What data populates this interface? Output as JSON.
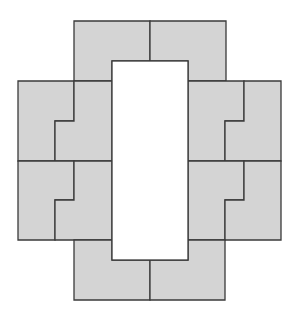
{
  "diagram": {
    "title": "",
    "width": 302,
    "height": 322,
    "fill": "#d4d4d4",
    "stroke": "#3a3a3a",
    "stroke_width": 1.3,
    "background": "#ffffff",
    "hole": {
      "x": 112,
      "y": 61,
      "width": 76,
      "height": 199
    },
    "pieces": [
      {
        "name": "piece-top-left",
        "points": "74,21 150,21 150,61 112,61 112,81 74,81"
      },
      {
        "name": "piece-top-right",
        "points": "150,21 226,21 226,81 188,81 188,61 150,61"
      },
      {
        "name": "piece-upper-left-outer",
        "points": "18,81 74,81 74,121 55,121 55,161 18,161"
      },
      {
        "name": "piece-upper-left-inner",
        "points": "74,81 112,81 112,161 55,161 55,121 74,121"
      },
      {
        "name": "piece-upper-right-inner",
        "points": "188,81 244,81 244,121 225,121 225,161 188,161"
      },
      {
        "name": "piece-upper-right-outer",
        "points": "244,81 281,81 281,161 225,161 225,121 244,121"
      },
      {
        "name": "piece-lower-left-outer",
        "points": "18,161 74,161 74,200 55,200 55,240 18,240"
      },
      {
        "name": "piece-lower-left-inner",
        "points": "74,161 112,161 112,240 55,240 55,200 74,200"
      },
      {
        "name": "piece-lower-right-inner",
        "points": "188,161 244,161 244,200 225,200 225,240 188,240"
      },
      {
        "name": "piece-lower-right-outer",
        "points": "244,161 281,161 281,240 225,240 225,200 244,200"
      },
      {
        "name": "piece-bottom-left",
        "points": "74,240 112,240 112,260 150,260 150,300 74,300"
      },
      {
        "name": "piece-bottom-right",
        "points": "150,260 188,260 188,240 225,240 225,300 150,300"
      }
    ]
  }
}
